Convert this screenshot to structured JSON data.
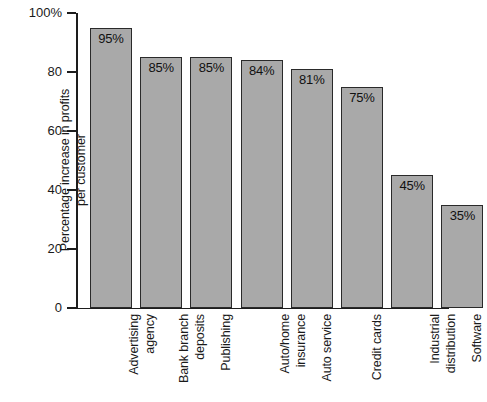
{
  "chart_data": {
    "type": "bar",
    "title": "",
    "subtitle": "",
    "xlabel": "",
    "ylabel": "Percentage increase in profits\nper customer",
    "ylabel_lines": [
      "Percentage increase in profits",
      "per customer"
    ],
    "categories": [
      "Advertising agency",
      "Bank branch deposits",
      "Publishing",
      "Auto/home insurance",
      "Auto service",
      "Credit cards",
      "Industrial distribution",
      "Software"
    ],
    "category_lines": [
      [
        "Advertising",
        "agency"
      ],
      [
        "Bank branch",
        "deposits"
      ],
      [
        "Publishing"
      ],
      [
        "Auto/home",
        "insurance"
      ],
      [
        "Auto service"
      ],
      [
        "Credit cards"
      ],
      [
        "Industrial",
        "distribution"
      ],
      [
        "Software"
      ]
    ],
    "values": [
      95,
      85,
      85,
      84,
      81,
      75,
      45,
      35
    ],
    "data_labels": [
      "95%",
      "85%",
      "85%",
      "84%",
      "81%",
      "75%",
      "45%",
      "35%"
    ],
    "ylim": [
      0,
      100
    ],
    "yticks": [
      0,
      20,
      40,
      60,
      80,
      100
    ],
    "ytick_labels": [
      "0",
      "20",
      "40",
      "60",
      "80",
      "100%"
    ],
    "grid": false,
    "legend": null,
    "legend_position": "none",
    "colors": {
      "bar_fill": "#a9a9a9",
      "bar_stroke": "#2a2a2a",
      "axis": "#1d1d1d",
      "text": "#1a1a1a",
      "background": "#ffffff"
    }
  }
}
